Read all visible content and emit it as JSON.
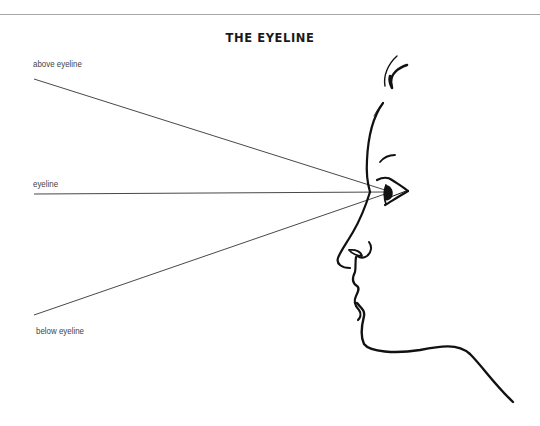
{
  "diagram": {
    "title": "THE EYELINE",
    "labels": {
      "above": "above eyeline",
      "eyeline": "eyeline",
      "below": "below eyeline"
    },
    "sight_lines": [
      {
        "name": "above-eyeline",
        "from": [
          34,
          79
        ],
        "to": [
          385,
          190
        ]
      },
      {
        "name": "eyeline",
        "from": [
          34,
          194
        ],
        "to": [
          385,
          192
        ]
      },
      {
        "name": "below-eyeline",
        "from": [
          34,
          315
        ],
        "to": [
          385,
          194
        ]
      }
    ],
    "colors": {
      "ink": "#111111",
      "sight_line": "#333333",
      "rule": "#a8a8a8",
      "label": "#444444"
    }
  }
}
